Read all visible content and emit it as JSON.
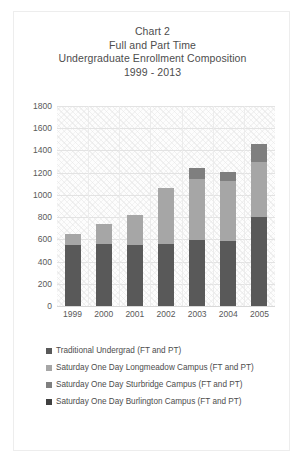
{
  "chart_data": {
    "type": "bar",
    "subtype": "stacked-column",
    "title": "Chart 2 Full and Part Time Undergraduate Enrollment Composition 1999 - 2013",
    "title_lines": [
      "Chart 2",
      "Full and Part Time",
      "Undergraduate Enrollment Composition",
      "1999 - 2013"
    ],
    "xlabel": "",
    "ylabel": "",
    "ylim": [
      0,
      1800
    ],
    "ytick_step": 200,
    "yticks": [
      "1800",
      "1600",
      "1400",
      "1200",
      "1000",
      "800",
      "600",
      "400",
      "200",
      "0"
    ],
    "ytick_values": [
      1800,
      1600,
      1400,
      1200,
      1000,
      800,
      600,
      400,
      200,
      0
    ],
    "categories": [
      "1999",
      "2000",
      "2001",
      "2002",
      "2003",
      "2004",
      "2005"
    ],
    "grid": true,
    "legend_position": "bottom",
    "series": [
      {
        "name": "Traditional Undergrad (FT and PT)",
        "color": "#595959",
        "values": [
          545,
          560,
          550,
          560,
          590,
          585,
          800
        ]
      },
      {
        "name": "Saturday One Day Longmeadow Campus (FT and PT)",
        "color": "#a6a6a6",
        "values": [
          105,
          175,
          265,
          500,
          555,
          540,
          495
        ]
      },
      {
        "name": "Saturday One Day Sturbridge Campus (FT and PT)",
        "color": "#7f7f7f",
        "values": [
          0,
          0,
          0,
          0,
          95,
          80,
          160
        ]
      },
      {
        "name": "Saturday One Day Burlington Campus (FT and PT)",
        "color": "#404040",
        "values": [
          0,
          0,
          0,
          0,
          0,
          0,
          0
        ]
      }
    ],
    "totals": [
      650,
      735,
      815,
      1060,
      1240,
      1205,
      1455
    ]
  },
  "legend": {
    "items": [
      {
        "label": "Traditional Undergrad (FT and PT)",
        "color": "#595959"
      },
      {
        "label": "Saturday One Day Longmeadow Campus (FT and PT)",
        "color": "#a6a6a6"
      },
      {
        "label": "Saturday One Day Sturbridge Campus (FT and PT)",
        "color": "#7f7f7f"
      },
      {
        "label": "Saturday One Day Burlington Campus (FT and PT)",
        "color": "#404040"
      }
    ]
  }
}
